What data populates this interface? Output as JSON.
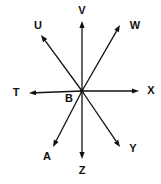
{
  "diagram": {
    "type": "concurrent-rays",
    "center": {
      "label": "B",
      "x": 82,
      "y": 91,
      "label_x": 69,
      "label_y": 99
    },
    "rays": [
      {
        "name": "V",
        "tip_x": 82,
        "tip_y": 21,
        "label_x": 82,
        "label_y": 11
      },
      {
        "name": "W",
        "tip_x": 120,
        "tip_y": 25,
        "label_x": 135,
        "label_y": 26
      },
      {
        "name": "X",
        "tip_x": 139,
        "tip_y": 91,
        "label_x": 151,
        "label_y": 91
      },
      {
        "name": "Y",
        "tip_x": 120,
        "tip_y": 147,
        "label_x": 133,
        "label_y": 149
      },
      {
        "name": "Z",
        "tip_x": 82,
        "tip_y": 159,
        "label_x": 82,
        "label_y": 171
      },
      {
        "name": "A",
        "tip_x": 53,
        "tip_y": 147,
        "label_x": 47,
        "label_y": 157
      },
      {
        "name": "T",
        "tip_x": 29,
        "tip_y": 93,
        "label_x": 16,
        "label_y": 93
      },
      {
        "name": "U",
        "tip_x": 41,
        "tip_y": 35,
        "label_x": 38,
        "label_y": 26
      }
    ],
    "colors": {
      "line": "#111111",
      "background": "#ffffff"
    }
  }
}
